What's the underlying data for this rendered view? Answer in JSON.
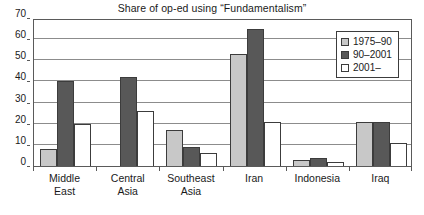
{
  "chart_data": {
    "type": "bar",
    "title": "Share of op-ed using “Fundamentalism”",
    "xlabel": "",
    "ylabel": "",
    "ylim": [
      0,
      70
    ],
    "yticks": [
      0,
      10,
      20,
      30,
      40,
      50,
      60,
      70
    ],
    "grid": true,
    "legend_position": "top-right",
    "categories": [
      "Middle\nEast",
      "Central\nAsia",
      "Southeast\nAsia",
      "Iran",
      "Indonesia",
      "Iraq"
    ],
    "category_lines": [
      [
        "Middle",
        "East"
      ],
      [
        "Central",
        "Asia"
      ],
      [
        "Southeast",
        "Asia"
      ],
      [
        "Iran",
        ""
      ],
      [
        "Indonesia",
        ""
      ],
      [
        "Iraq",
        ""
      ]
    ],
    "series": [
      {
        "name": "1975–90",
        "color": "#c8c8c8",
        "values": [
          8,
          0,
          17,
          53,
          3,
          21
        ]
      },
      {
        "name": "90–2001",
        "color": "#585858",
        "values": [
          40,
          42,
          9,
          65,
          4,
          21
        ]
      },
      {
        "name": "2001–",
        "color": "#ffffff",
        "values": [
          20,
          26,
          6,
          21,
          2,
          11
        ]
      }
    ]
  },
  "colors": {
    "series_1975_90": "#c8c8c8",
    "series_90_2001": "#585858",
    "series_2001_plus": "#ffffff",
    "bar_outline": "#3c3c3c",
    "gridline": "#8c8c8c",
    "axis": "#5a5a5a",
    "text": "#1a1a1a",
    "background": "#ffffff"
  }
}
